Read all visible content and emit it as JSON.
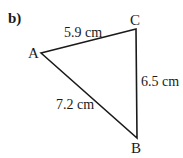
{
  "part_label": "b)",
  "triangle": {
    "vertices": {
      "A": "A",
      "B": "B",
      "C": "C"
    },
    "sides": {
      "AC": "5.9 cm",
      "CB": "6.5 cm",
      "AB": "7.2 cm"
    }
  }
}
